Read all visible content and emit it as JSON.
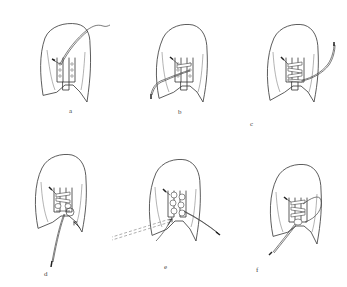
{
  "figure": {
    "title": "",
    "panels": [
      {
        "id": "a",
        "label": "a",
        "step": "Lace threaded through top eyelet, long end extends up and right"
      },
      {
        "id": "b",
        "label": "b",
        "step": "Lace crossed through second eyelets, end extends down and left"
      },
      {
        "id": "c",
        "label": "c",
        "step": "Lace woven through all eyelets, end extends right"
      },
      {
        "id": "d",
        "label": "d",
        "step": "Loop formed at bottom eyelets, arrow indicates pull, end extends down"
      },
      {
        "id": "e",
        "label": "e",
        "step": "Lace wrapped around knot, dashed line shows pull direction left"
      },
      {
        "id": "f",
        "label": "f",
        "step": "Finished lacing with loop, end extends down-left"
      }
    ]
  },
  "colors": {
    "background": "#ffffff",
    "line": "#333333"
  }
}
